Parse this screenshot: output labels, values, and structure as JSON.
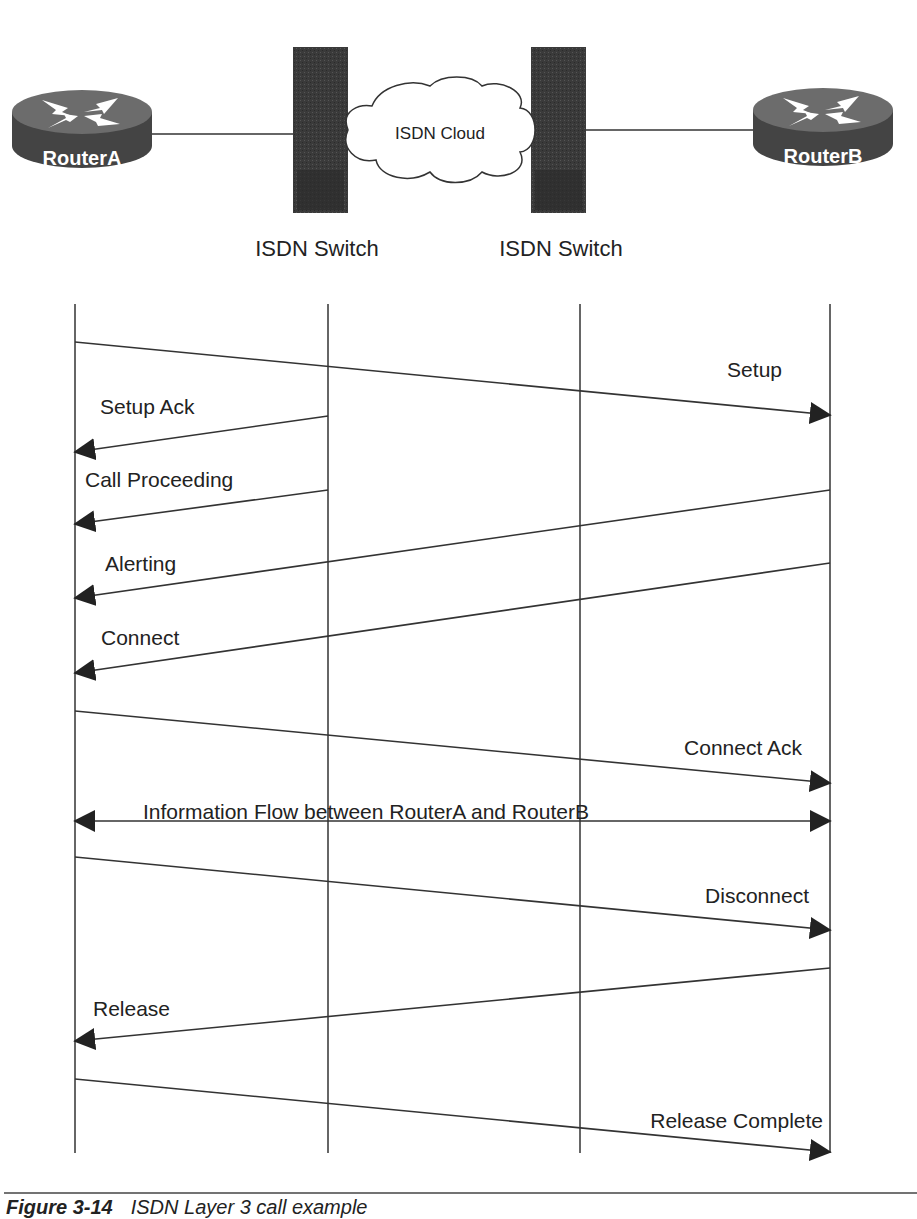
{
  "topology": {
    "router_a": {
      "label": "RouterA"
    },
    "router_b": {
      "label": "RouterB"
    },
    "cloud": {
      "label": "ISDN Cloud"
    },
    "switch_left": {
      "label": "ISDN Switch"
    },
    "switch_right": {
      "label": "ISDN Switch"
    }
  },
  "lifelines": [
    {
      "name": "RouterA",
      "x": 75
    },
    {
      "name": "ISDN Switch (A side)",
      "x": 328
    },
    {
      "name": "ISDN Switch (B side)",
      "x": 580
    },
    {
      "name": "RouterB",
      "x": 830
    }
  ],
  "messages": [
    {
      "label": "Setup",
      "direction": "A->B"
    },
    {
      "label": "Setup Ack",
      "direction": "SwitchA->A"
    },
    {
      "label": "Call Proceeding",
      "direction": "SwitchA->A"
    },
    {
      "label": "Alerting",
      "direction": "B->A"
    },
    {
      "label": "Connect",
      "direction": "B->A"
    },
    {
      "label": "Connect Ack",
      "direction": "A->B"
    },
    {
      "label": "Information Flow between RouterA and RouterB",
      "direction": "A<->B"
    },
    {
      "label": "Disconnect",
      "direction": "A->B"
    },
    {
      "label": "Release",
      "direction": "B->A"
    },
    {
      "label": "Release Complete",
      "direction": "A->B"
    }
  ],
  "caption": {
    "figure": "Figure 3-14",
    "title": "ISDN Layer 3 call example"
  },
  "colors": {
    "line": "#333333",
    "router_body": "#4a4a4a",
    "router_top": "#6e6e6e",
    "switch": "#3a3a3a"
  }
}
